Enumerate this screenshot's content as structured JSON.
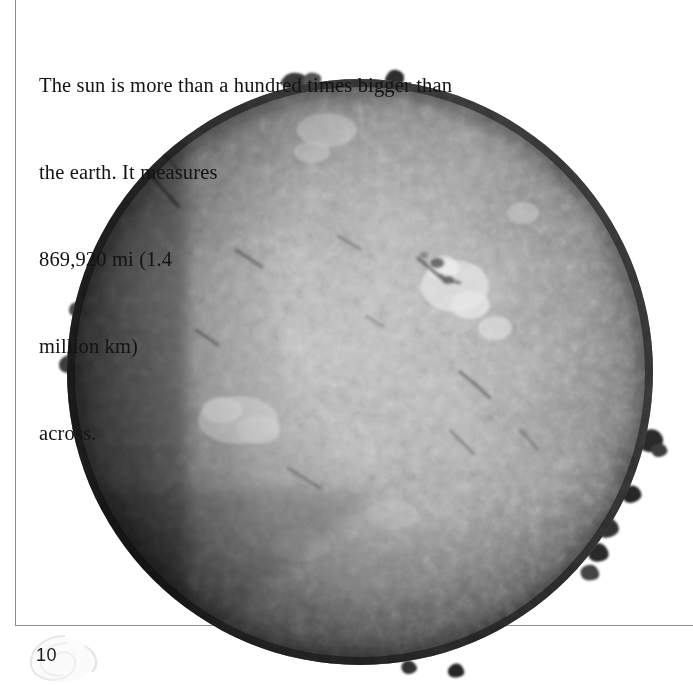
{
  "page": {
    "title": "The sun",
    "page_number": "10",
    "background_color": "#ffffff",
    "rule_color": "#8d8d8d",
    "text_color": "#131313"
  },
  "caption": {
    "text": "The sun is more than a hundred times bigger than the earth. It measures\n869,920 mi (1.4\nmillion km)\nacross.",
    "line_1": "The sun is more than a hundred times bigger than",
    "line_2": "the earth. It measures",
    "line_3": "869,920 mi (1.4",
    "line_4": "million km)",
    "line_5": "across.",
    "measurement_miles": "869,920 mi",
    "measurement_km": "1.4 million km",
    "comparison": "more than a hundred times bigger than the earth"
  },
  "figure": {
    "disc_center_x": 360,
    "disc_center_y": 372,
    "disc_radius": 293,
    "limb_color": "#1c1c1c",
    "mid_color": "#8c8c8c",
    "center_color": "#bdbdbd",
    "plage_color": "#e9e9e9",
    "filament_color": "#4a4a4a",
    "prominences": [
      {
        "angle_deg": 258,
        "size": 12
      },
      {
        "angle_deg": 272,
        "size": 9
      },
      {
        "angle_deg": 12,
        "size": 13
      },
      {
        "angle_deg": 26,
        "size": 10
      },
      {
        "angle_deg": 34,
        "size": 16
      },
      {
        "angle_deg": 96,
        "size": 8
      },
      {
        "angle_deg": 104,
        "size": 7
      },
      {
        "angle_deg": 186,
        "size": 8
      }
    ],
    "plages": [
      {
        "cx": 455,
        "cy": 288,
        "r": 36
      },
      {
        "cx": 492,
        "cy": 327,
        "r": 20
      },
      {
        "cx": 238,
        "cy": 421,
        "r": 38
      },
      {
        "cx": 330,
        "cy": 128,
        "r": 26
      },
      {
        "cx": 318,
        "cy": 155,
        "r": 16
      },
      {
        "cx": 524,
        "cy": 214,
        "r": 18
      }
    ],
    "filaments": [
      {
        "x1": 150,
        "y1": 175,
        "x2": 176,
        "y2": 205
      },
      {
        "x1": 420,
        "y1": 262,
        "x2": 444,
        "y2": 281
      },
      {
        "x1": 462,
        "y1": 375,
        "x2": 489,
        "y2": 396
      },
      {
        "x1": 290,
        "y1": 470,
        "x2": 318,
        "y2": 487
      },
      {
        "x1": 452,
        "y1": 432,
        "x2": 472,
        "y2": 452
      },
      {
        "x1": 238,
        "y1": 252,
        "x2": 262,
        "y2": 268
      }
    ]
  },
  "footer": {
    "watermark": "sun-swirl-watermark",
    "page_label": "10"
  }
}
